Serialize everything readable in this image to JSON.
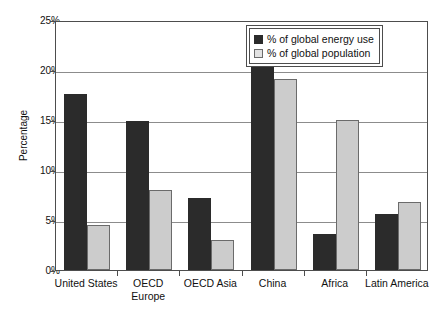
{
  "chart_data": {
    "type": "bar",
    "title": "",
    "xlabel": "",
    "ylabel": "Percentage",
    "ylim": [
      0,
      25
    ],
    "ytick_values": [
      0,
      5,
      10,
      15,
      20,
      25
    ],
    "ytick_labels": [
      "0%",
      "5%",
      "10%",
      "15%",
      "20%",
      "25%"
    ],
    "grid": true,
    "legend_position": "top-right",
    "categories": [
      "United States",
      "OECD Europe",
      "OECD Asia",
      "China",
      "Africa",
      "Latin America"
    ],
    "category_lines": [
      [
        "United States"
      ],
      [
        "OECD",
        "Europe"
      ],
      [
        "OECD Asia"
      ],
      [
        "China"
      ],
      [
        "Africa"
      ],
      [
        "Latin America"
      ]
    ],
    "series": [
      {
        "name": "% of global energy use",
        "color": "#2b2b2b",
        "values": [
          17.6,
          14.9,
          7.2,
          21.7,
          3.6,
          5.6
        ]
      },
      {
        "name": "% of global population",
        "color": "#cccccc",
        "values": [
          4.5,
          8.0,
          3.0,
          19.1,
          15.0,
          6.8
        ]
      }
    ]
  },
  "legend": {
    "items": [
      {
        "label": "% of global energy use",
        "swatch": "dark-square-swatch"
      },
      {
        "label": "% of global population",
        "swatch": "light-square-swatch"
      }
    ]
  },
  "axes": {
    "y_title": "Percentage"
  }
}
